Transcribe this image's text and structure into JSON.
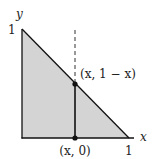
{
  "diagram": {
    "axes": {
      "x_label": "x",
      "y_label": "y",
      "x_tick": "1",
      "y_tick": "1"
    },
    "points": {
      "top": "(x, 1 − x)",
      "bottom": "(x, 0)"
    },
    "colors": {
      "fill": "#d4d4d4",
      "stroke": "#111111",
      "background": "#ffffff"
    }
  }
}
